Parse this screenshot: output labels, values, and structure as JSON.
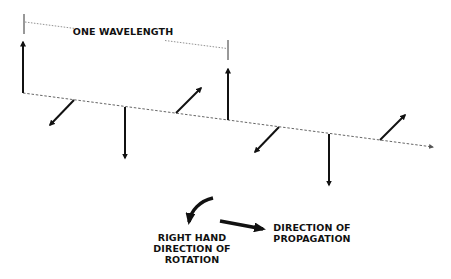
{
  "diagram": {
    "title_label": "ONE WAVELENGTH",
    "rotation_label_lines": [
      "RIGHT HAND",
      "DIRECTION OF",
      "ROTATION"
    ],
    "propagation_label_lines": [
      "DIRECTION OF",
      "PROPAGATION"
    ],
    "colors": {
      "ink": "#111111",
      "background": "#ffffff",
      "axis": "#555555"
    },
    "vectors": [
      {
        "orientation": "up"
      },
      {
        "orientation": "down-left"
      },
      {
        "orientation": "down"
      },
      {
        "orientation": "up-right"
      },
      {
        "orientation": "up"
      },
      {
        "orientation": "down-left"
      },
      {
        "orientation": "down"
      },
      {
        "orientation": "up-right"
      }
    ]
  }
}
